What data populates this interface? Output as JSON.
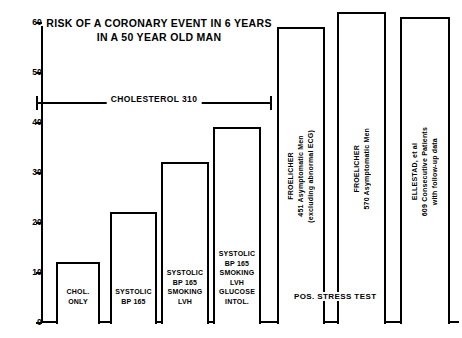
{
  "chart_data": {
    "type": "bar",
    "title": "RISK OF A CORONARY EVENT IN 6 YEARS\nIN A 50 YEAR OLD MAN",
    "xlabel": "",
    "ylabel": "",
    "ylim": [
      0,
      60
    ],
    "grid": false,
    "legend": "none",
    "ytick_labels": [
      "60",
      "50",
      "40",
      "30",
      "20",
      "10",
      "0"
    ],
    "ytick_values": [
      60,
      50,
      40,
      30,
      20,
      10,
      0
    ],
    "categories": [
      "CHOL.\nONLY",
      "SYSTOLIC\nBP 165",
      "SYSTOLIC\nBP 165\nSMOKING\nLVH",
      "SYSTOLIC\nBP 165\nSMOKING\nLVH\nGLUCOSE\nINTOL.",
      "FROELICHER\n451 Asymptomatic Men\n(excluding abnormal ECG)",
      "FROELICHER\n570 Asymptomatic Men",
      "ELLESTAD, et al\n609 Consecutive Patients\nwith follow-up data"
    ],
    "values": [
      12,
      22,
      32,
      39,
      59,
      62,
      61
    ],
    "annotations": [
      "CHOLESTEROL 310",
      "POS. STRESS TEST"
    ]
  },
  "bars": [
    {
      "label": "CHOL.\nONLY",
      "value": 12,
      "orientation": "horizontal",
      "left": 56,
      "width": 44
    },
    {
      "label": "SYSTOLIC\nBP 165",
      "value": 22,
      "orientation": "horizontal",
      "left": 110,
      "width": 47
    },
    {
      "label": "SYSTOLIC\nBP 165\nSMOKING\nLVH",
      "value": 32,
      "orientation": "horizontal",
      "left": 161,
      "width": 48
    },
    {
      "label": "SYSTOLIC\nBP 165\nSMOKING\nLVH\nGLUCOSE\nINTOL.",
      "value": 39,
      "orientation": "horizontal",
      "left": 213,
      "width": 48
    },
    {
      "label": "FROELICHER\n451 Asymptomatic Men\n(excluding abnormal ECG)",
      "value": 59,
      "orientation": "vertical",
      "left": 277,
      "width": 48
    },
    {
      "label": "FROELICHER\n570 Asymptomatic Men",
      "value": 62,
      "orientation": "vertical",
      "left": 337,
      "width": 49
    },
    {
      "label": "ELLESTAD, et al\n609 Consecutive Patients\nwith follow-up data",
      "value": 61,
      "orientation": "vertical",
      "left": 400,
      "width": 50
    }
  ],
  "axis": {
    "ticks": [
      {
        "label": "60",
        "value": 60
      },
      {
        "label": "50",
        "value": 50
      },
      {
        "label": "40",
        "value": 40
      },
      {
        "label": "30",
        "value": 30
      },
      {
        "label": "20",
        "value": 20
      },
      {
        "label": "10",
        "value": 10
      },
      {
        "label": "0",
        "value": 0
      }
    ]
  },
  "bracket": {
    "text": "CHOLESTEROL 310"
  },
  "stress_test": {
    "text": "POS. STRESS TEST"
  },
  "colors": {
    "ink": "#000000",
    "paper": "#ffffff"
  }
}
